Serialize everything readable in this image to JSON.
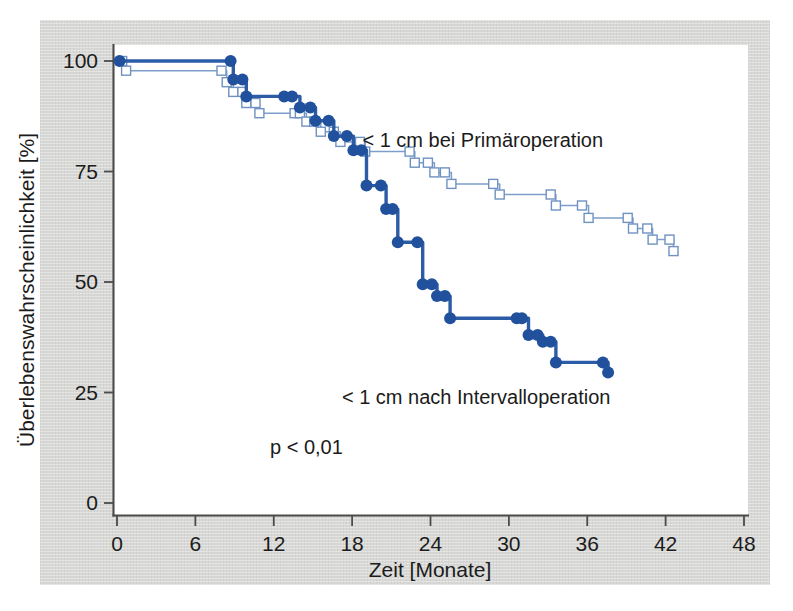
{
  "chart_data": {
    "type": "line",
    "title": "",
    "xlabel": "Zeit [Monate]",
    "ylabel": "Überlebenswahrscheinlichkeit [%]",
    "xlim": [
      0,
      48
    ],
    "ylim": [
      0,
      100
    ],
    "xticks": [
      0,
      6,
      12,
      18,
      24,
      30,
      36,
      42,
      48
    ],
    "xtick_labels": [
      "0",
      "6",
      "12",
      "18",
      "24",
      "30",
      "36",
      "42",
      "48"
    ],
    "yticks": [
      0,
      25,
      50,
      75,
      100
    ],
    "ytick_labels": [
      "0",
      "25",
      "50",
      "75",
      "100"
    ],
    "grid": false,
    "legend_position": "inline-annotation",
    "annotations": [
      {
        "text": "p < 0,01",
        "x": 14.5,
        "y": 11
      },
      {
        "text": "< 1 cm bei Primäroperation",
        "x": 28.0,
        "y": 80.5
      },
      {
        "text": "< 1 cm nach Intervalloperation",
        "x": 27.5,
        "y": 22.5
      }
    ],
    "series": [
      {
        "name": "< 1 cm bei Primäroperation",
        "marker": "open-square",
        "color": "#7d9ecb",
        "label": "< 1 cm bei Primäroperation",
        "points": [
          {
            "x": 0.4,
            "y": 100.0
          },
          {
            "x": 0.7,
            "y": 97.8
          },
          {
            "x": 8.0,
            "y": 97.8
          },
          {
            "x": 8.4,
            "y": 95.2
          },
          {
            "x": 8.9,
            "y": 93.0
          },
          {
            "x": 9.6,
            "y": 93.0
          },
          {
            "x": 9.9,
            "y": 90.5
          },
          {
            "x": 10.6,
            "y": 90.5
          },
          {
            "x": 10.9,
            "y": 88.2
          },
          {
            "x": 13.6,
            "y": 88.2
          },
          {
            "x": 14.0,
            "y": 88.2
          },
          {
            "x": 14.5,
            "y": 86.3
          },
          {
            "x": 15.1,
            "y": 86.3
          },
          {
            "x": 15.6,
            "y": 84.0
          },
          {
            "x": 16.6,
            "y": 84.0
          },
          {
            "x": 17.1,
            "y": 81.7
          },
          {
            "x": 18.6,
            "y": 81.7
          },
          {
            "x": 19.0,
            "y": 79.5
          },
          {
            "x": 22.4,
            "y": 79.5
          },
          {
            "x": 22.8,
            "y": 77.0
          },
          {
            "x": 23.8,
            "y": 77.0
          },
          {
            "x": 24.3,
            "y": 74.8
          },
          {
            "x": 25.1,
            "y": 74.8
          },
          {
            "x": 25.6,
            "y": 72.2
          },
          {
            "x": 28.8,
            "y": 72.2
          },
          {
            "x": 29.3,
            "y": 69.8
          },
          {
            "x": 33.2,
            "y": 69.8
          },
          {
            "x": 33.6,
            "y": 67.3
          },
          {
            "x": 35.6,
            "y": 67.3
          },
          {
            "x": 36.1,
            "y": 64.5
          },
          {
            "x": 39.1,
            "y": 64.5
          },
          {
            "x": 39.5,
            "y": 62.1
          },
          {
            "x": 40.6,
            "y": 62.1
          },
          {
            "x": 41.0,
            "y": 59.6
          },
          {
            "x": 42.3,
            "y": 59.6
          },
          {
            "x": 42.6,
            "y": 57.0
          }
        ]
      },
      {
        "name": "< 1 cm nach Intervalloperation",
        "marker": "filled-circle",
        "color": "#2d5ca6",
        "label": "< 1 cm nach Intervalloperation",
        "points": [
          {
            "x": 0.2,
            "y": 100.0
          },
          {
            "x": 8.7,
            "y": 100.0
          },
          {
            "x": 8.9,
            "y": 95.8
          },
          {
            "x": 9.6,
            "y": 95.8
          },
          {
            "x": 9.9,
            "y": 92.0
          },
          {
            "x": 12.8,
            "y": 92.0
          },
          {
            "x": 13.4,
            "y": 92.0
          },
          {
            "x": 14.0,
            "y": 89.5
          },
          {
            "x": 14.8,
            "y": 89.5
          },
          {
            "x": 15.2,
            "y": 86.5
          },
          {
            "x": 16.2,
            "y": 86.5
          },
          {
            "x": 16.6,
            "y": 83.0
          },
          {
            "x": 17.6,
            "y": 83.0
          },
          {
            "x": 18.1,
            "y": 79.8
          },
          {
            "x": 18.7,
            "y": 79.8
          },
          {
            "x": 19.1,
            "y": 71.8
          },
          {
            "x": 20.2,
            "y": 71.8
          },
          {
            "x": 20.6,
            "y": 66.5
          },
          {
            "x": 21.1,
            "y": 66.5
          },
          {
            "x": 21.5,
            "y": 59.0
          },
          {
            "x": 23.0,
            "y": 59.0
          },
          {
            "x": 23.4,
            "y": 49.5
          },
          {
            "x": 24.1,
            "y": 49.5
          },
          {
            "x": 24.5,
            "y": 46.8
          },
          {
            "x": 25.1,
            "y": 46.8
          },
          {
            "x": 25.5,
            "y": 41.8
          },
          {
            "x": 30.6,
            "y": 41.8
          },
          {
            "x": 31.0,
            "y": 41.8
          },
          {
            "x": 31.5,
            "y": 38.0
          },
          {
            "x": 32.2,
            "y": 38.0
          },
          {
            "x": 32.6,
            "y": 36.5
          },
          {
            "x": 33.2,
            "y": 36.5
          },
          {
            "x": 33.6,
            "y": 31.8
          },
          {
            "x": 37.2,
            "y": 31.8
          },
          {
            "x": 37.6,
            "y": 29.5
          }
        ]
      }
    ]
  },
  "figure": {
    "background_color": "#d8d8d6",
    "plot_background_color": "#ffffff",
    "axis_color": "#4b4b4b",
    "solid_series_color": "#2d5ca6",
    "open_series_color": "#7d9ecb"
  }
}
